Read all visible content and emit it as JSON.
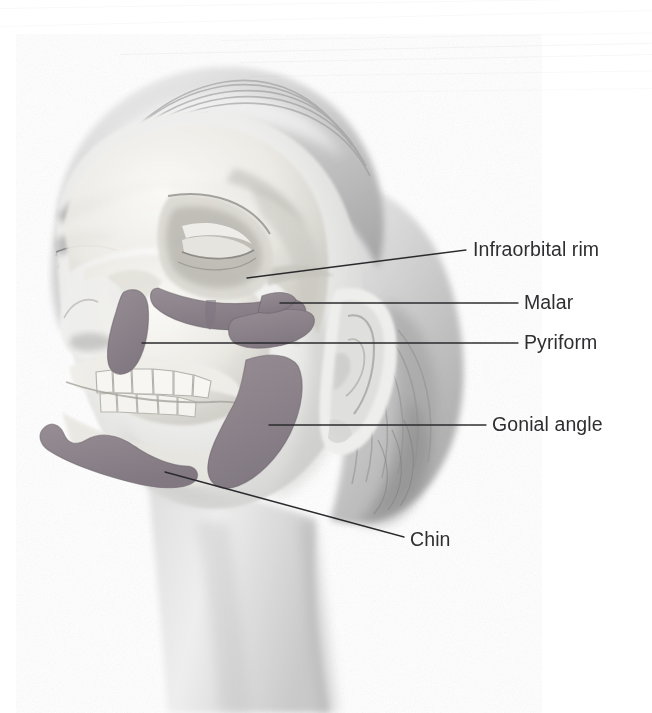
{
  "figure": {
    "view": "three-quarter lateral view of a female head with skull overlay",
    "background_color": "#ffffff",
    "palette": {
      "background": "#ffffff",
      "skin_light": "#f2f2f1",
      "skin_mid": "#d8d8d6",
      "skin_shadow": "#b9b9b7",
      "bone_light": "#f4f3ef",
      "bone_mid": "#dedcd6",
      "bone_shadow": "#b5b3ad",
      "hair_light": "#e3e3e2",
      "hair_mid": "#b8b8b8",
      "hair_dark": "#8e8e8e",
      "highlight_fill": "#8b8289",
      "highlight_fill_alt": "#968d94",
      "highlight_stroke": "#6d656c",
      "leader_line": "#2b2b2e",
      "label_text": "#2e2e31"
    }
  },
  "labels": [
    {
      "id": "infraorbital-rim",
      "text": "Infraorbital rim",
      "text_x": 473,
      "text_y": 250,
      "leader": {
        "x1": 247,
        "y1": 278,
        "x2": 466,
        "y2": 250
      }
    },
    {
      "id": "malar",
      "text": "Malar",
      "text_x": 524,
      "text_y": 303,
      "leader": {
        "x1": 280,
        "y1": 303,
        "x2": 518,
        "y2": 303
      }
    },
    {
      "id": "pyriform",
      "text": "Pyriform",
      "text_x": 524,
      "text_y": 343,
      "leader": {
        "x1": 142,
        "y1": 343,
        "x2": 518,
        "y2": 343
      }
    },
    {
      "id": "gonial-angle",
      "text": "Gonial angle",
      "text_x": 492,
      "text_y": 425,
      "leader": {
        "x1": 269,
        "y1": 425,
        "x2": 486,
        "y2": 425
      }
    },
    {
      "id": "chin",
      "text": "Chin",
      "text_x": 410,
      "text_y": 540,
      "leader": {
        "x1": 165,
        "y1": 472,
        "x2": 404,
        "y2": 537
      }
    }
  ],
  "highlighted_structures": [
    {
      "id": "infraorbital-rim",
      "name": "Infraorbital rim",
      "description": "crescent band of bone along the inferior orbital margin"
    },
    {
      "id": "malar",
      "name": "Malar",
      "description": "zygomatic (cheek) eminence band lateral to the maxilla"
    },
    {
      "id": "pyriform",
      "name": "Pyriform",
      "description": "lateral margin of the pear-shaped nasal aperture"
    },
    {
      "id": "gonial-angle",
      "name": "Gonial angle",
      "description": "ramus and angle of the mandible"
    },
    {
      "id": "chin",
      "name": "Chin",
      "description": "mental / chin region of the mandibular body"
    }
  ],
  "scanlines": [
    {
      "x": 0,
      "y": 8,
      "w": 652,
      "rot": -0.9,
      "opacity": 0.18
    },
    {
      "x": 0,
      "y": 26,
      "w": 652,
      "rot": -1.4,
      "opacity": 0.14
    },
    {
      "x": 120,
      "y": 54,
      "w": 532,
      "rot": -1.2,
      "opacity": 0.22
    },
    {
      "x": 220,
      "y": 40,
      "w": 432,
      "rot": -1.0,
      "opacity": 0.16
    },
    {
      "x": 240,
      "y": 62,
      "w": 412,
      "rot": -1.1,
      "opacity": 0.2
    },
    {
      "x": 250,
      "y": 76,
      "w": 402,
      "rot": -0.8,
      "opacity": 0.16
    },
    {
      "x": 330,
      "y": 92,
      "w": 322,
      "rot": -0.7,
      "opacity": 0.13
    }
  ]
}
